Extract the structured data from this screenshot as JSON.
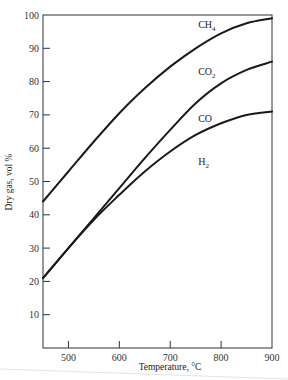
{
  "chart_data": {
    "type": "line",
    "title": "",
    "xlabel": "Temperature, °C",
    "ylabel": "Dry gas, vol %",
    "xlim": [
      450,
      900
    ],
    "ylim": [
      0,
      100
    ],
    "x_ticks": [
      500,
      600,
      700,
      800,
      900
    ],
    "y_ticks": [
      10,
      20,
      30,
      40,
      50,
      60,
      70,
      80,
      90,
      100
    ],
    "grid": false,
    "legend": "inline labels between curves",
    "series": [
      {
        "name": "CH4",
        "role": "upper boundary (CH4 region above)",
        "x": [
          450,
          500,
          550,
          600,
          650,
          700,
          750,
          800,
          850,
          900
        ],
        "y": [
          44,
          53,
          62,
          70.5,
          78,
          84.5,
          90,
          94.5,
          97.5,
          99
        ]
      },
      {
        "name": "CO2",
        "role": "boundary between CH4 and CO2 regions",
        "x": [
          450,
          500,
          550,
          600,
          650,
          700,
          750,
          800,
          850,
          900
        ],
        "y": [
          21,
          30,
          39,
          48,
          57,
          65.5,
          73.5,
          79.5,
          83.5,
          86
        ]
      },
      {
        "name": "CO",
        "role": "boundary between CO and H2 regions",
        "x": [
          450,
          500,
          550,
          600,
          650,
          700,
          750,
          800,
          850,
          900
        ],
        "y": [
          21,
          30,
          38.5,
          46,
          53,
          59,
          64,
          67.5,
          70,
          71
        ]
      }
    ],
    "region_labels": [
      {
        "text": "CH",
        "sub": "4",
        "x": 755,
        "y": 96
      },
      {
        "text": "CO",
        "sub": "2",
        "x": 755,
        "y": 82
      },
      {
        "text": "CO",
        "sub": "",
        "x": 755,
        "y": 68
      },
      {
        "text": "H",
        "sub": "2",
        "x": 755,
        "y": 55
      }
    ]
  }
}
